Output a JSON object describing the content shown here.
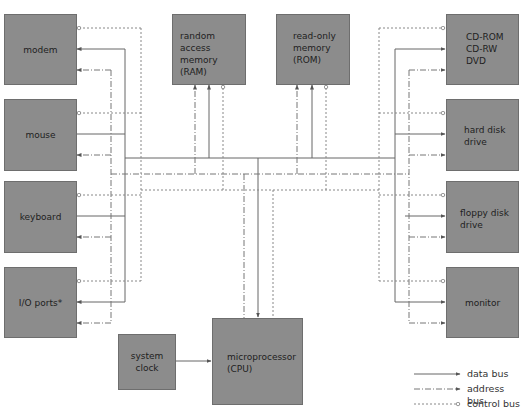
{
  "diagram": {
    "components": {
      "modem": "modem",
      "mouse": "mouse",
      "keyboard": "keyboard",
      "io_ports": "I/O ports*",
      "ram": "random access\nmemory\n(RAM)",
      "rom": "read-only\nmemory\n(ROM)",
      "cd": "CD-ROM\nCD-RW\nDVD",
      "hard_disk": "hard disk\ndrive",
      "floppy": "floppy disk\ndrive",
      "monitor": "monitor",
      "system_clock": "system clock",
      "cpu": "microprocessor\n(CPU)"
    },
    "legend": [
      {
        "style": "solid",
        "label": "data bus"
      },
      {
        "style": "dash-dot",
        "label": "address bus"
      },
      {
        "style": "dotted",
        "label": "control bus"
      }
    ],
    "colors": {
      "box_fill": "#8c8c8c",
      "box_border": "#6e6e6e",
      "line": "#6a6a6a",
      "text": "#1e1e1e"
    }
  }
}
